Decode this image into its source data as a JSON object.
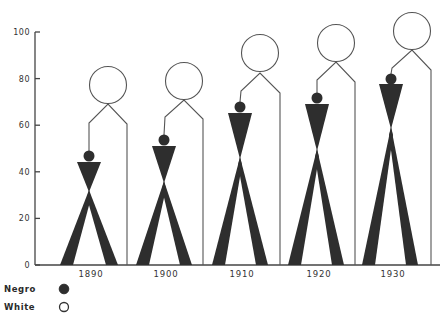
{
  "chart_data": {
    "type": "pictogram",
    "title": "",
    "xlabel": "",
    "ylabel": "",
    "ylim": [
      0,
      100
    ],
    "y_ticks": [
      0,
      20,
      40,
      60,
      80,
      100
    ],
    "categories": [
      "1890",
      "1900",
      "1910",
      "1920",
      "1930"
    ],
    "series": [
      {
        "name": "Negro",
        "marker": "filled-circle",
        "color": "#2e2e2e",
        "values": [
          44,
          51,
          65,
          69,
          78
        ]
      },
      {
        "name": "White",
        "marker": "open-circle",
        "color": "#ffffff",
        "values": [
          61,
          63,
          74,
          79,
          84
        ]
      }
    ],
    "grid": false,
    "legend_position": "bottom-left"
  },
  "axis": {
    "y_tick_labels": [
      "0",
      "20",
      "40",
      "60",
      "80",
      "100"
    ]
  },
  "legend": {
    "items": [
      {
        "label": "Negro",
        "icon": "filled-circle-icon"
      },
      {
        "label": "White",
        "icon": "open-circle-icon"
      }
    ]
  },
  "figures": [
    {
      "year": "1890",
      "cx": 89,
      "negro_head_cy": 156,
      "tri_top": 162,
      "apex": 190,
      "leg_l": [
        60,
        73
      ],
      "leg_r": [
        106,
        118
      ],
      "white_cx": 108,
      "white_cy": 85,
      "neck": 104,
      "sh_l": [
        89,
        123
      ],
      "sh_r": [
        127,
        124
      ]
    },
    {
      "year": "1900",
      "cx": 164,
      "negro_head_cy": 140,
      "tri_top": 146,
      "apex": 181,
      "leg_l": [
        136,
        149
      ],
      "leg_r": [
        180,
        192
      ],
      "white_cx": 184,
      "white_cy": 81,
      "neck": 100,
      "sh_l": [
        165,
        117
      ],
      "sh_r": [
        203,
        119
      ]
    },
    {
      "year": "1910",
      "cx": 240,
      "negro_head_cy": 107,
      "tri_top": 113,
      "apex": 157,
      "leg_l": [
        212,
        225
      ],
      "leg_r": [
        256,
        268
      ],
      "white_cx": 260,
      "white_cy": 53,
      "neck": 73,
      "sh_l": [
        241,
        91
      ],
      "sh_r": [
        280,
        93
      ]
    },
    {
      "year": "1920",
      "cx": 317,
      "negro_head_cy": 98,
      "tri_top": 104,
      "apex": 149,
      "leg_l": [
        288,
        301
      ],
      "leg_r": [
        332,
        344
      ],
      "white_cx": 336,
      "white_cy": 43,
      "neck": 62,
      "sh_l": [
        317,
        80
      ],
      "sh_r": [
        355,
        82
      ]
    },
    {
      "year": "1930",
      "cx": 391,
      "negro_head_cy": 79,
      "tri_top": 84,
      "apex": 127,
      "leg_l": [
        362,
        375
      ],
      "leg_r": [
        406,
        418
      ],
      "white_cx": 412,
      "white_cy": 31,
      "neck": 50,
      "sh_l": [
        392,
        68
      ],
      "sh_r": [
        431,
        70
      ]
    }
  ]
}
